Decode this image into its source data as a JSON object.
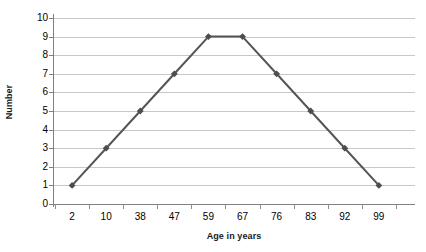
{
  "chart_data": {
    "type": "line",
    "title": "",
    "subtitle": "",
    "xlabel": "Age in years",
    "ylabel": "Number",
    "categories": [
      "2",
      "10",
      "38",
      "47",
      "59",
      "67",
      "76",
      "83",
      "92",
      "99"
    ],
    "values": [
      1,
      3,
      5,
      7,
      9,
      9,
      7,
      5,
      3,
      1
    ],
    "series": [
      {
        "name": "Number",
        "values": [
          1,
          3,
          5,
          7,
          9,
          9,
          7,
          5,
          3,
          1
        ]
      }
    ],
    "ylim": [
      0,
      10
    ],
    "ytick_labels": [
      "0",
      "1",
      "2",
      "3",
      "4",
      "5",
      "6",
      "7",
      "8",
      "9",
      "10"
    ],
    "ytick_values": [
      0,
      1,
      2,
      3,
      4,
      5,
      6,
      7,
      8,
      9,
      10
    ],
    "ytick_step": 1,
    "grid": "horizontal",
    "legend": "none",
    "marker": "diamond",
    "annotations": [],
    "colors": {
      "line": "#555555",
      "marker": "#4d4d4d",
      "gridline": "#c8c8c8",
      "axis": "#808080",
      "background": "#ffffff",
      "text": "#000000"
    }
  }
}
